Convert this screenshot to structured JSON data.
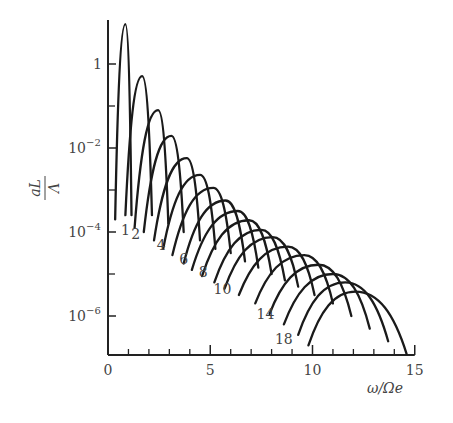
{
  "chart_data": {
    "type": "line",
    "title": "",
    "xlabel": "ω/Ωe",
    "ylabel": "aL/Λ",
    "xscale": "linear",
    "yscale": "log",
    "xlim": [
      0,
      15
    ],
    "ylim_log10": [
      -7.0,
      1.0
    ],
    "x_ticks": [
      0,
      5,
      10,
      15
    ],
    "x_minor_ticks": [
      1,
      2,
      3,
      4,
      6,
      7,
      8,
      9,
      11,
      12,
      13,
      14
    ],
    "y_ticks": [
      {
        "log10": 0,
        "label": "1"
      },
      {
        "log10": -2,
        "label": "10",
        "exp": "−2"
      },
      {
        "log10": -4,
        "label": "10",
        "exp": "−4"
      },
      {
        "log10": -6,
        "label": "10",
        "exp": "−6"
      }
    ],
    "y_minor_ticks_log10": [
      -1,
      -3,
      -5
    ],
    "grid": false,
    "legend": "none",
    "curve_labels": [
      {
        "text": "1",
        "x": 0.85,
        "log10": -3.95
      },
      {
        "text": "2",
        "x": 1.35,
        "log10": -4.05
      },
      {
        "text": "4",
        "x": 2.6,
        "log10": -4.3
      },
      {
        "text": "6",
        "x": 3.7,
        "log10": -4.65
      },
      {
        "text": "8",
        "x": 4.65,
        "log10": -4.95
      },
      {
        "text": "10",
        "x": 5.6,
        "log10": -5.35
      },
      {
        "text": "14",
        "x": 7.7,
        "log10": -5.95
      },
      {
        "text": "18",
        "x": 8.6,
        "log10": -6.55
      }
    ],
    "series": [
      {
        "name": "1",
        "start_x": 0.35,
        "start_log10": -3.7,
        "peak_x": 0.85,
        "peak_log10": 0.95,
        "end_x": 1.15,
        "end_log10": -3.6
      },
      {
        "name": "2",
        "start_x": 0.85,
        "start_log10": -3.6,
        "peak_x": 1.67,
        "peak_log10": -0.29,
        "end_x": 2.15,
        "end_log10": -3.6
      },
      {
        "name": "3",
        "start_x": 1.3,
        "start_log10": -3.9,
        "peak_x": 2.45,
        "peak_log10": -1.1,
        "end_x": 2.95,
        "end_log10": -3.8
      },
      {
        "name": "4",
        "start_x": 1.75,
        "start_log10": -4.0,
        "peak_x": 3.1,
        "peak_log10": -1.71,
        "end_x": 3.7,
        "end_log10": -4.0
      },
      {
        "name": "5",
        "start_x": 2.25,
        "start_log10": -4.2,
        "peak_x": 3.85,
        "peak_log10": -2.24,
        "end_x": 4.5,
        "end_log10": -4.2
      },
      {
        "name": "6",
        "start_x": 2.7,
        "start_log10": -4.4,
        "peak_x": 4.5,
        "peak_log10": -2.64,
        "end_x": 5.25,
        "end_log10": -4.4
      },
      {
        "name": "7",
        "start_x": 3.15,
        "start_log10": -4.55,
        "peak_x": 5.15,
        "peak_log10": -2.95,
        "end_x": 6.0,
        "end_log10": -4.5
      },
      {
        "name": "8",
        "start_x": 3.7,
        "start_log10": -4.75,
        "peak_x": 5.75,
        "peak_log10": -3.25,
        "end_x": 6.7,
        "end_log10": -4.7
      },
      {
        "name": "9",
        "start_x": 4.1,
        "start_log10": -4.9,
        "peak_x": 6.35,
        "peak_log10": -3.5,
        "end_x": 7.35,
        "end_log10": -4.85
      },
      {
        "name": "10",
        "start_x": 4.6,
        "start_log10": -5.05,
        "peak_x": 6.9,
        "peak_log10": -3.72,
        "end_x": 8.0,
        "end_log10": -5.0
      },
      {
        "name": "11",
        "start_x": 5.2,
        "start_log10": -5.2,
        "peak_x": 7.5,
        "peak_log10": -3.95,
        "end_x": 8.65,
        "end_log10": -5.15
      },
      {
        "name": "12",
        "start_x": 5.7,
        "start_log10": -5.35,
        "peak_x": 8.05,
        "peak_log10": -4.12,
        "end_x": 9.3,
        "end_log10": -5.3
      },
      {
        "name": "13",
        "start_x": 6.4,
        "start_log10": -5.5,
        "peak_x": 8.8,
        "peak_log10": -4.35,
        "end_x": 10.1,
        "end_log10": -5.5
      },
      {
        "name": "14",
        "start_x": 7.2,
        "start_log10": -5.7,
        "peak_x": 9.6,
        "peak_log10": -4.55,
        "end_x": 11.0,
        "end_log10": -5.7
      },
      {
        "name": "15",
        "start_x": 7.9,
        "start_log10": -5.95,
        "peak_x": 10.3,
        "peak_log10": -4.78,
        "end_x": 11.9,
        "end_log10": -6.0
      },
      {
        "name": "16",
        "start_x": 8.6,
        "start_log10": -6.2,
        "peak_x": 11.0,
        "peak_log10": -5.0,
        "end_x": 12.8,
        "end_log10": -6.3
      },
      {
        "name": "17",
        "start_x": 9.3,
        "start_log10": -6.45,
        "peak_x": 11.6,
        "peak_log10": -5.2,
        "end_x": 13.7,
        "end_log10": -6.6
      },
      {
        "name": "18",
        "start_x": 9.8,
        "start_log10": -6.7,
        "peak_x": 12.1,
        "peak_log10": -5.42,
        "end_x": 14.6,
        "end_log10": -6.9
      }
    ]
  }
}
